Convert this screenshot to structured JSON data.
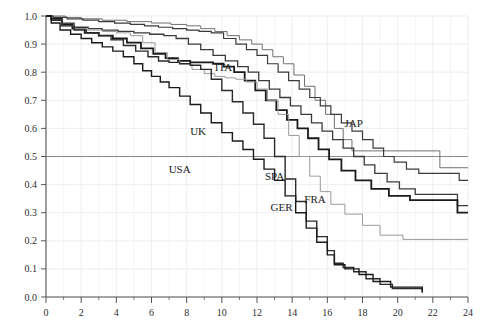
{
  "chart_data": {
    "type": "line",
    "title": "",
    "subtitle": "",
    "xlabel": "",
    "ylabel": "",
    "xlim": [
      0,
      24
    ],
    "ylim": [
      0.0,
      1.0
    ],
    "xticks": [
      0,
      2,
      4,
      6,
      8,
      10,
      12,
      14,
      16,
      18,
      20,
      22,
      24
    ],
    "xticklabels": [
      "0",
      "2",
      "4",
      "6",
      "8",
      "10",
      "12",
      "14",
      "16",
      "18",
      "20",
      "22",
      "24"
    ],
    "xminorticks": [
      1,
      3,
      5,
      7,
      9,
      11,
      13,
      15,
      17,
      19,
      21,
      23
    ],
    "yticks": [
      0.0,
      0.1,
      0.2,
      0.3,
      0.4,
      0.5,
      0.6,
      0.7,
      0.8,
      0.9,
      1.0
    ],
    "yticklabels": [
      "0.0",
      "0.1",
      "0.2",
      "0.3",
      "0.4",
      "0.5",
      "0.6",
      "0.7",
      "0.8",
      "0.9",
      "1.0"
    ],
    "grid": true,
    "grid_color": "#e8e8f0",
    "frame_color": "#555555",
    "reference_lines": [
      {
        "name": "median-reference-line",
        "orientation": "horizontal",
        "y": 0.5,
        "color": "#8a8a8a"
      }
    ],
    "legend": "inline-labels",
    "step_interpolation": "post",
    "series": [
      {
        "name": "JAP",
        "label": "JAP",
        "color": "#707070",
        "width": 1.0,
        "label_xy": [
          17.5,
          0.605
        ],
        "x": [
          0,
          0.3,
          1.1,
          2.0,
          3.2,
          4.6,
          6.0,
          7.1,
          8.0,
          8.8,
          9.6,
          10.3,
          11.0,
          11.7,
          12.3,
          12.9,
          13.5,
          14.1,
          14.7,
          15.3,
          15.9,
          16.4,
          16.9,
          17.4,
          22.4,
          24
        ],
        "y": [
          1.0,
          1.0,
          0.995,
          0.99,
          0.985,
          0.98,
          0.975,
          0.97,
          0.965,
          0.955,
          0.945,
          0.93,
          0.915,
          0.9,
          0.88,
          0.855,
          0.83,
          0.79,
          0.75,
          0.7,
          0.65,
          0.6,
          0.56,
          0.52,
          0.46,
          0.46
        ]
      },
      {
        "name": "ITA",
        "label": "ITA",
        "color": "#3a3a3a",
        "width": 1.2,
        "label_xy": [
          10.1,
          0.805
        ],
        "x": [
          0,
          0.4,
          1.2,
          2.1,
          3.0,
          3.9,
          4.8,
          5.6,
          6.4,
          7.2,
          8.0,
          8.7,
          9.4,
          10.1,
          10.8,
          11.4,
          12.0,
          12.6,
          13.2,
          13.8,
          14.4,
          15.0,
          15.6,
          16.2,
          16.8,
          17.4,
          18.0,
          18.6,
          19.2,
          19.8,
          20.5,
          21.2,
          23.5,
          24
        ],
        "y": [
          1.0,
          0.995,
          0.99,
          0.985,
          0.98,
          0.975,
          0.97,
          0.965,
          0.96,
          0.955,
          0.95,
          0.945,
          0.94,
          0.92,
          0.9,
          0.88,
          0.86,
          0.83,
          0.8,
          0.77,
          0.74,
          0.71,
          0.68,
          0.65,
          0.62,
          0.59,
          0.56,
          0.53,
          0.5,
          0.48,
          0.455,
          0.44,
          0.415,
          0.415
        ]
      },
      {
        "name": "SPA",
        "label": "SPA",
        "color": "#3a3a3a",
        "width": 1.3,
        "label_xy": [
          13.0,
          0.415
        ],
        "x": [
          0,
          0.3,
          0.9,
          1.6,
          2.4,
          3.2,
          4.1,
          5.0,
          5.9,
          6.7,
          7.4,
          8.1,
          8.8,
          9.5,
          10.2,
          10.9,
          11.5,
          12.1,
          12.7,
          13.3,
          13.9,
          14.5,
          15.1,
          15.7,
          16.3,
          16.9,
          17.5,
          18.1,
          18.7,
          19.4,
          20.1,
          21.0,
          23.4,
          24
        ],
        "y": [
          1.0,
          0.99,
          0.975,
          0.96,
          0.955,
          0.95,
          0.945,
          0.94,
          0.935,
          0.93,
          0.92,
          0.9,
          0.88,
          0.86,
          0.84,
          0.82,
          0.8,
          0.77,
          0.74,
          0.71,
          0.68,
          0.65,
          0.62,
          0.59,
          0.56,
          0.53,
          0.5,
          0.47,
          0.44,
          0.41,
          0.385,
          0.365,
          0.325,
          0.325
        ]
      },
      {
        "name": "FRA",
        "label": "FRA",
        "color": "#1a1a1a",
        "width": 1.8,
        "label_xy": [
          15.3,
          0.335
        ],
        "x": [
          0,
          0.3,
          0.9,
          1.5,
          2.2,
          3.0,
          3.8,
          4.6,
          5.4,
          6.1,
          6.8,
          7.5,
          8.2,
          8.9,
          9.5,
          10.1,
          10.7,
          11.3,
          11.9,
          12.5,
          13.1,
          13.7,
          14.3,
          14.9,
          15.5,
          16.1,
          16.8,
          17.6,
          18.5,
          19.5,
          20.7,
          23.4,
          24
        ],
        "y": [
          1.0,
          0.99,
          0.97,
          0.955,
          0.94,
          0.93,
          0.92,
          0.905,
          0.885,
          0.865,
          0.85,
          0.84,
          0.835,
          0.835,
          0.83,
          0.82,
          0.8,
          0.77,
          0.735,
          0.7,
          0.665,
          0.63,
          0.6,
          0.565,
          0.525,
          0.49,
          0.45,
          0.415,
          0.385,
          0.36,
          0.345,
          0.3,
          0.3
        ]
      },
      {
        "name": "GER",
        "label": "GER",
        "color": "#9a9a9a",
        "width": 1.0,
        "label_xy": [
          13.4,
          0.305
        ],
        "x": [
          0,
          0.3,
          0.9,
          1.6,
          2.4,
          3.2,
          4.0,
          4.8,
          5.5,
          6.2,
          6.9,
          7.6,
          8.3,
          9.0,
          9.6,
          10.2,
          10.8,
          11.4,
          12.0,
          12.6,
          13.2,
          13.8,
          14.4,
          15.0,
          15.6,
          16.2,
          17.0,
          18.0,
          19.0,
          20.3,
          24
        ],
        "y": [
          1.0,
          0.985,
          0.965,
          0.955,
          0.95,
          0.945,
          0.94,
          0.93,
          0.905,
          0.87,
          0.845,
          0.83,
          0.81,
          0.795,
          0.785,
          0.78,
          0.775,
          0.765,
          0.74,
          0.7,
          0.65,
          0.575,
          0.5,
          0.43,
          0.375,
          0.33,
          0.295,
          0.255,
          0.22,
          0.205,
          0.205
        ]
      },
      {
        "name": "UK",
        "label": "UK",
        "color": "#2a2a2a",
        "width": 1.4,
        "label_xy": [
          8.65,
          0.575
        ],
        "x": [
          0,
          0.3,
          0.9,
          1.6,
          2.3,
          3.0,
          3.7,
          4.4,
          5.1,
          5.8,
          6.4,
          7.0,
          7.6,
          8.2,
          8.8,
          9.4,
          10.0,
          10.6,
          11.2,
          11.8,
          12.4,
          13.0,
          13.6,
          14.2,
          14.8,
          15.4,
          16.0,
          16.4,
          16.9,
          17.5,
          18.2,
          19.0,
          19.7,
          21.4
        ],
        "y": [
          1.0,
          0.985,
          0.965,
          0.95,
          0.94,
          0.93,
          0.915,
          0.895,
          0.875,
          0.855,
          0.84,
          0.835,
          0.83,
          0.825,
          0.81,
          0.775,
          0.735,
          0.695,
          0.655,
          0.615,
          0.565,
          0.5,
          0.42,
          0.34,
          0.27,
          0.215,
          0.165,
          0.12,
          0.105,
          0.09,
          0.065,
          0.045,
          0.03,
          0.02
        ]
      },
      {
        "name": "USA",
        "label": "USA",
        "color": "#1a1a1a",
        "width": 1.4,
        "label_xy": [
          7.6,
          0.44
        ],
        "x": [
          0,
          0.3,
          0.8,
          1.4,
          2.0,
          2.6,
          3.2,
          3.8,
          4.4,
          5.0,
          5.5,
          6.0,
          6.5,
          7.0,
          7.6,
          8.2,
          8.8,
          9.4,
          10.0,
          10.6,
          11.2,
          11.8,
          12.4,
          13.0,
          13.6,
          14.2,
          14.8,
          15.4,
          16.0,
          16.4,
          17.0,
          17.8,
          18.6,
          19.6,
          21.4
        ],
        "y": [
          1.0,
          0.975,
          0.95,
          0.935,
          0.92,
          0.905,
          0.89,
          0.875,
          0.855,
          0.83,
          0.805,
          0.785,
          0.765,
          0.745,
          0.715,
          0.685,
          0.655,
          0.62,
          0.585,
          0.555,
          0.525,
          0.49,
          0.455,
          0.415,
          0.36,
          0.3,
          0.245,
          0.195,
          0.15,
          0.115,
          0.1,
          0.08,
          0.055,
          0.035,
          0.015
        ]
      }
    ]
  }
}
